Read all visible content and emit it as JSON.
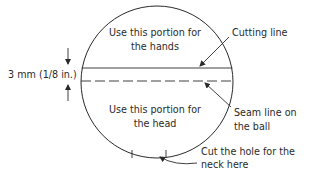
{
  "diagram": {
    "type": "ball-cutting-guide",
    "colors": {
      "ink": "#2a2a2a",
      "background": "#ffffff"
    },
    "circle": {
      "cx": 157,
      "cy": 82,
      "r": 76
    },
    "lines": {
      "cutting_line_y": 68,
      "seam_line_y": 81
    },
    "regions": {
      "upper": {
        "line1": "Use this portion for",
        "line2": "the hands"
      },
      "lower": {
        "line1": "Use this portion for",
        "line2": "the head"
      }
    },
    "dimension": {
      "label": "3 mm (1/8 in.)"
    },
    "callouts": {
      "cutting": {
        "line1": "Cutting line"
      },
      "seam": {
        "line1": "Seam line on",
        "line2": "the ball"
      },
      "neck": {
        "line1": "Cut the hole for the",
        "line2": "neck here"
      }
    },
    "neck_ticks_x": [
      132,
      166
    ]
  }
}
